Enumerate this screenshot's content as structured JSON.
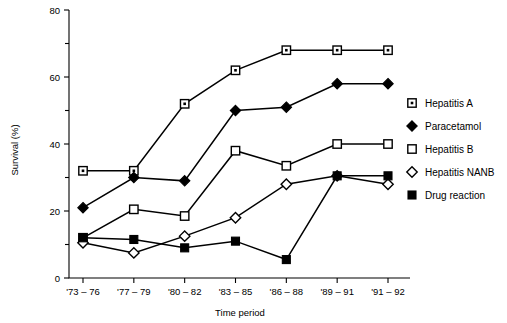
{
  "chart_data": {
    "type": "line",
    "title": "",
    "xlabel": "Time period",
    "ylabel": "Survival (%)",
    "categories": [
      "'73 – 76",
      "'77 – 79",
      "'80 – 82",
      "'83 – 85",
      "'86 – 88",
      "'89 – 91",
      "'91 – 92"
    ],
    "ylim": [
      0,
      80
    ],
    "yticks": [
      0,
      20,
      40,
      60,
      80
    ],
    "yticks_minor": [
      10,
      30,
      50,
      70
    ],
    "ytick_labels": [
      "0",
      "20",
      "40",
      "60",
      "80"
    ],
    "grid": false,
    "legend_position": "right",
    "series": [
      {
        "name": "Hepatitis A",
        "marker": "square-dot",
        "values": [
          32,
          32,
          52,
          62,
          68,
          68,
          68
        ]
      },
      {
        "name": "Paracetamol",
        "marker": "diamond-filled",
        "values": [
          21,
          30,
          29,
          50,
          51,
          58,
          58
        ]
      },
      {
        "name": "Hepatitis B",
        "marker": "square-open",
        "values": [
          12,
          20.5,
          18.5,
          38,
          33.5,
          40,
          40
        ]
      },
      {
        "name": "Hepatitis NANB",
        "marker": "diamond-open",
        "values": [
          10.5,
          7.5,
          12.5,
          18,
          28,
          30.5,
          28
        ]
      },
      {
        "name": "Drug reaction",
        "marker": "square-filled",
        "values": [
          12,
          11.5,
          9,
          11,
          5.5,
          30.5,
          30.5
        ]
      }
    ]
  },
  "legend": {
    "items": [
      {
        "label": "Hepatitis A",
        "marker": "square-dot"
      },
      {
        "label": "Paracetamol",
        "marker": "diamond-filled"
      },
      {
        "label": "Hepatitis B",
        "marker": "square-open"
      },
      {
        "label": "Hepatitis NANB",
        "marker": "diamond-open"
      },
      {
        "label": "Drug reaction",
        "marker": "square-filled"
      }
    ]
  },
  "axes": {
    "x_title": "Time period",
    "y_title": "Survival (%)"
  }
}
